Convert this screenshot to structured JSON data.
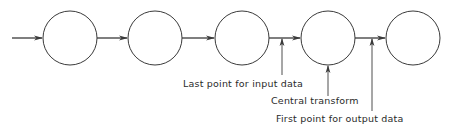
{
  "diagram": {
    "colors": {
      "stroke": "#3a3a3a",
      "text": "#2a2a2a",
      "background": "#ffffff"
    },
    "nodes": [
      {
        "id": "n1",
        "cx": 70,
        "cy": 38,
        "r": 27
      },
      {
        "id": "n2",
        "cx": 155,
        "cy": 38,
        "r": 27
      },
      {
        "id": "n3",
        "cx": 242,
        "cy": 38,
        "r": 27
      },
      {
        "id": "n4",
        "cx": 328,
        "cy": 38,
        "r": 27
      },
      {
        "id": "n5",
        "cx": 413,
        "cy": 38,
        "r": 27
      }
    ],
    "edges": [
      {
        "from": "input",
        "to": "n1"
      },
      {
        "from": "n1",
        "to": "n2"
      },
      {
        "from": "n2",
        "to": "n3"
      },
      {
        "from": "n3",
        "to": "n4"
      },
      {
        "from": "n4",
        "to": "n5"
      }
    ],
    "annotations": [
      {
        "id": "last-input",
        "text": "Last point for input data",
        "pointer_x": 282,
        "pointer_top": 38,
        "pointer_bottom": 75,
        "label_x": 183,
        "label_y": 87
      },
      {
        "id": "central",
        "text": "Central transform",
        "pointer_x": 328,
        "pointer_top": 65,
        "pointer_bottom": 96,
        "label_x": 271,
        "label_y": 104
      },
      {
        "id": "first-output",
        "text": "First point for output data",
        "pointer_x": 372,
        "pointer_top": 38,
        "pointer_bottom": 111,
        "label_x": 276,
        "label_y": 122
      }
    ]
  }
}
